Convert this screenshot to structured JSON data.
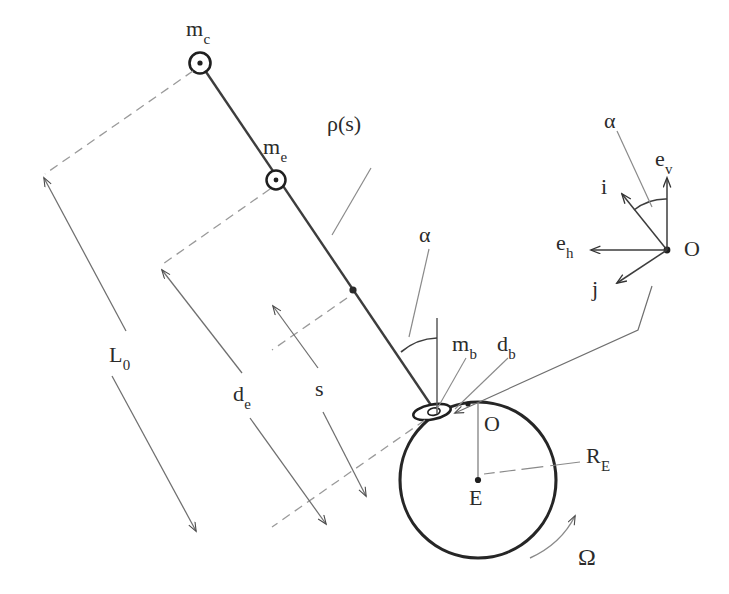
{
  "figure": {
    "type": "technical-diagram",
    "background_color": "#ffffff",
    "ink_color": "#3a3a3a",
    "dark_ink_color": "#222222"
  },
  "labels": {
    "mass_climber": {
      "text": "m",
      "sub": "c"
    },
    "mass_end": {
      "text": "m",
      "sub": "e"
    },
    "mass_base": {
      "text": "m",
      "sub": "b"
    },
    "density": {
      "text": "ρ(s)"
    },
    "length_total": {
      "text": "L",
      "sub": "0"
    },
    "distance_end": {
      "text": "d",
      "sub": "e"
    },
    "arc_coordinate": {
      "text": "s"
    },
    "distance_base": {
      "text": "d",
      "sub": "b"
    },
    "angle_tether": {
      "text": "α"
    },
    "angle_frame": {
      "text": "α"
    },
    "origin_frame": {
      "text": "O"
    },
    "origin_surface": {
      "text": "O"
    },
    "earth_center": {
      "text": "E"
    },
    "earth_radius": {
      "text": "R",
      "sub": "E"
    },
    "earth_rotation": {
      "text": "Ω"
    },
    "unit_vertical": {
      "text": "e",
      "sub": "v"
    },
    "unit_horizontal": {
      "text": "e",
      "sub": "h"
    },
    "unit_i": {
      "text": "i"
    },
    "unit_j": {
      "text": "j"
    }
  },
  "geometry": {
    "earth": {
      "cx": 478,
      "cy": 480,
      "r": 78
    },
    "tether_top": {
      "x": 200,
      "y": 63
    },
    "tether_base": {
      "x": 437,
      "y": 414
    },
    "node_end": {
      "x": 276,
      "y": 180
    },
    "node_s": {
      "x": 353,
      "y": 290
    },
    "frame_origin": {
      "x": 667,
      "y": 250
    }
  }
}
